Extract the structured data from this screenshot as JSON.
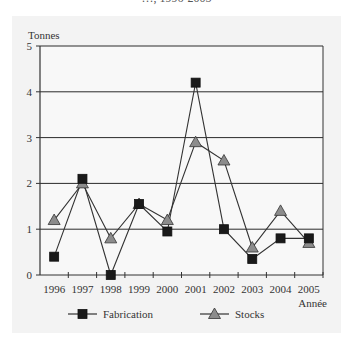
{
  "title": "…, 1996-2005",
  "chart_data": {
    "type": "line",
    "title": "…, 1996-2005",
    "xlabel": "Année",
    "ylabel": "Tonnes",
    "ylim": [
      0,
      5
    ],
    "yticks": [
      0,
      1,
      2,
      3,
      4,
      5
    ],
    "grid": true,
    "legend_position": "bottom",
    "categories": [
      "1996",
      "1997",
      "1998",
      "1999",
      "2000",
      "2001",
      "2002",
      "2003",
      "2004",
      "2005"
    ],
    "series": [
      {
        "name": "Fabrication",
        "marker": "square",
        "color": "#1a1a1a",
        "values": [
          0.4,
          2.1,
          0.0,
          1.55,
          0.95,
          4.2,
          1.0,
          0.35,
          0.8,
          0.8
        ]
      },
      {
        "name": "Stocks",
        "marker": "triangle",
        "color": "#8c8c8c",
        "values": [
          1.2,
          2.0,
          0.8,
          1.55,
          1.2,
          2.9,
          2.5,
          0.6,
          1.4,
          0.7
        ]
      }
    ]
  },
  "legend": {
    "items": [
      {
        "label": "Fabrication",
        "marker": "square"
      },
      {
        "label": "Stocks",
        "marker": "triangle"
      }
    ]
  },
  "colors": {
    "panel": "#f3f3f3",
    "plot_bg": "#f8f8f8",
    "axis": "#333333",
    "line": "#333333",
    "square_fill": "#1a1a1a",
    "triangle_fill": "#8c8c8c"
  }
}
